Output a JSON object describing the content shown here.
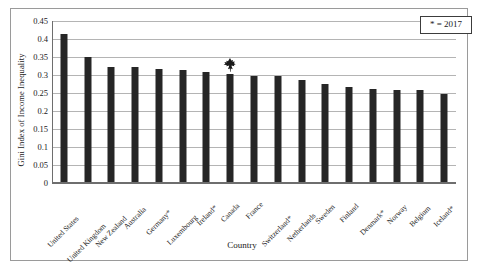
{
  "chart_data": {
    "type": "bar",
    "title": "",
    "xlabel": "Country",
    "ylabel": "Gini Index of Income Inequality",
    "ylim": [
      0,
      0.45
    ],
    "ytick_step": 0.05,
    "yticks": [
      "0.45",
      "0.4",
      "0.35",
      "0.3",
      "0.25",
      "0.2",
      "0.15",
      "0.1",
      "0.05",
      "0"
    ],
    "ytick_values": [
      0.45,
      0.4,
      0.35,
      0.3,
      0.25,
      0.2,
      0.15,
      0.1,
      0.05,
      0
    ],
    "grid": true,
    "legend_position": "top-right",
    "legend_entries": [
      "* = 2017"
    ],
    "bar_color": "#262626",
    "categories": [
      "United States",
      "United Kingdom",
      "New Zealand",
      "Australia",
      "Germany*",
      "Luxembourg",
      "Ireland*",
      "Canada",
      "France",
      "Switzerland*",
      "Netherlands",
      "Sweden",
      "Finland",
      "Denmark*",
      "Norway",
      "Belgium",
      "Iceland*"
    ],
    "values": [
      0.413,
      0.349,
      0.323,
      0.323,
      0.317,
      0.315,
      0.309,
      0.302,
      0.298,
      0.296,
      0.285,
      0.275,
      0.266,
      0.261,
      0.259,
      0.258,
      0.246
    ],
    "annotations": [
      {
        "name": "maple-leaf-marker",
        "category": "Canada",
        "label": "maple-leaf-icon",
        "color": "#1a1a1a"
      }
    ]
  },
  "legend": {
    "text": "* = 2017"
  },
  "axes": {
    "x_title": "Country",
    "y_title": "Gini Index of Income Inequality"
  }
}
